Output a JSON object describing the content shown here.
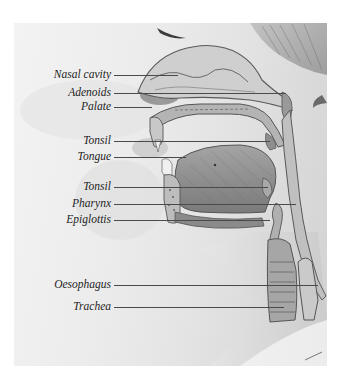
{
  "figure": {
    "colors": {
      "background": "#ffffff",
      "skin_light": "#eeeeee",
      "skin_shadow": "#bdbdbd",
      "tissue": "#9a9a9a",
      "outline": "#5a5a5a",
      "leader_line": "#4a4a4a",
      "label_text": "#1e1e1e"
    },
    "labels": [
      {
        "text": "Nasal cavity",
        "y": 75,
        "line_end_x": 178
      },
      {
        "text": "Adenoids",
        "y": 93,
        "line_end_x": 286
      },
      {
        "text": "Palate",
        "y": 107,
        "line_end_x": 152
      },
      {
        "text": "Tonsil",
        "y": 141,
        "line_end_x": 270
      },
      {
        "text": "Tongue",
        "y": 157,
        "line_end_x": 186
      },
      {
        "text": "Tonsil",
        "y": 187,
        "line_end_x": 268
      },
      {
        "text": "Pharynx",
        "y": 204,
        "line_end_x": 296
      },
      {
        "text": "Epiglottis",
        "y": 220,
        "line_end_x": 270
      },
      {
        "text": "Oesophagus",
        "y": 285,
        "line_end_x": 318
      },
      {
        "text": "Trachea",
        "y": 307,
        "line_end_x": 284
      }
    ]
  }
}
